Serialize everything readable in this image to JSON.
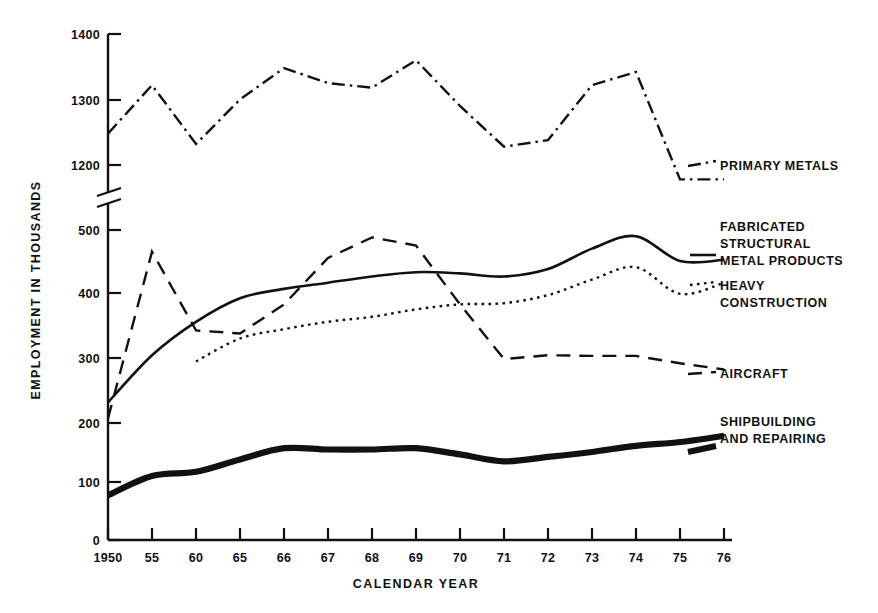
{
  "chart_data": {
    "type": "line",
    "title": "",
    "xlabel": "CALENDAR YEAR",
    "ylabel": "EMPLOYMENT IN THOUSANDS",
    "categories": [
      "1950",
      "55",
      "60",
      "65",
      "66",
      "67",
      "68",
      "69",
      "70",
      "71",
      "72",
      "73",
      "74",
      "75",
      "76"
    ],
    "x_tick_labels": [
      "1950",
      "55",
      "60",
      "65",
      "66",
      "67",
      "68",
      "69",
      "70",
      "71",
      "72",
      "73",
      "74",
      "75",
      "76"
    ],
    "y_tick_labels_upper": [
      "1400",
      "1300",
      "1200"
    ],
    "y_tick_labels_lower": [
      "500",
      "400",
      "300",
      "200",
      "100",
      "0"
    ],
    "y_axis_broken": true,
    "y_break_between": [
      1200,
      500
    ],
    "ylim_upper": [
      1200,
      1400
    ],
    "ylim_lower": [
      0,
      500
    ],
    "grid": false,
    "legend_position": "right-inline-labels",
    "series": [
      {
        "name": "PRIMARY METALS",
        "style": "dash-dot",
        "label_lines": [
          "PRIMARY METALS"
        ],
        "values": [
          1248,
          1322,
          1232,
          1300,
          1348,
          1325,
          1318,
          1360,
          1290,
          1228,
          1238,
          1322,
          1342,
          1178,
          1178
        ]
      },
      {
        "name": "FABRICATED STRUCTURAL METAL PRODUCTS",
        "style": "solid",
        "label_lines": [
          "FABRICATED",
          "STRUCTURAL",
          "METAL PRODUCTS"
        ],
        "values": [
          222,
          298,
          352,
          390,
          405,
          415,
          425,
          432,
          430,
          425,
          437,
          470,
          490,
          450,
          452
        ]
      },
      {
        "name": "HEAVY CONSTRUCTION",
        "style": "dotted",
        "label_lines": [
          "HEAVY",
          "CONSTRUCTION"
        ],
        "values": [
          null,
          null,
          288,
          325,
          340,
          352,
          360,
          372,
          380,
          382,
          395,
          420,
          440,
          397,
          415
        ]
      },
      {
        "name": "AIRCRAFT",
        "style": "dashed",
        "label_lines": [
          "AIRCRAFT"
        ],
        "values": [
          196,
          465,
          338,
          333,
          380,
          455,
          488,
          475,
          380,
          292,
          298,
          297,
          297,
          285,
          275
        ]
      },
      {
        "name": "SHIPBUILDING AND REPAIRING",
        "style": "thick-solid",
        "label_lines": [
          "SHIPBUILDING",
          "AND REPAIRING"
        ],
        "values": [
          72,
          103,
          110,
          130,
          148,
          146,
          146,
          148,
          138,
          127,
          134,
          142,
          152,
          158,
          168
        ]
      }
    ]
  },
  "colors": {
    "ink": "#111111",
    "background": "#ffffff"
  },
  "labels": {
    "primary_metals": "PRIMARY METALS",
    "fabricated_1": "FABRICATED",
    "fabricated_2": "STRUCTURAL",
    "fabricated_3": "METAL PRODUCTS",
    "heavy_1": "HEAVY",
    "heavy_2": "CONSTRUCTION",
    "aircraft": "AIRCRAFT",
    "ship_1": "SHIPBUILDING",
    "ship_2": "AND REPAIRING"
  },
  "axis": {
    "x_title": "CALENDAR YEAR",
    "y_title": "EMPLOYMENT IN THOUSANDS"
  }
}
